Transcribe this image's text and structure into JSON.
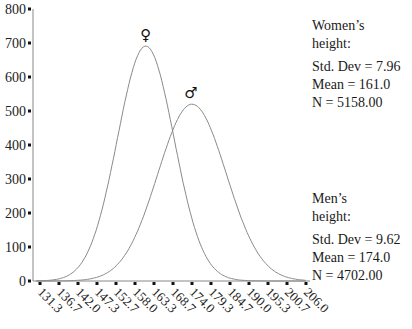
{
  "chart_data": {
    "type": "line",
    "title": "",
    "xlabel": "",
    "ylabel": "",
    "ylim": [
      0,
      800
    ],
    "yticks": [
      0,
      100,
      200,
      300,
      400,
      500,
      600,
      700,
      800
    ],
    "xticks": [
      "131.3",
      "136.7",
      "142.0",
      "147.3",
      "152.7",
      "158.0",
      "163.3",
      "168.7",
      "174.0",
      "179.3",
      "184.7",
      "190.0",
      "195.3",
      "200.7",
      "206.0"
    ],
    "xlim": [
      131.3,
      206.0
    ],
    "grid": false,
    "series": [
      {
        "name": "Women's height",
        "symbol": "♀",
        "mean": 161.0,
        "std_dev": 7.96,
        "n": 5158,
        "peak": 691,
        "x": [
          131.3,
          136.7,
          142.0,
          147.3,
          152.7,
          158.0,
          161.0,
          163.3,
          168.7,
          174.0,
          179.3,
          184.7,
          190.0,
          195.3,
          200.7,
          206.0
        ],
        "values": [
          3,
          23,
          100,
          300,
          399,
          643,
          691,
          660,
          432,
          182,
          49,
          8,
          1,
          0,
          0,
          0
        ]
      },
      {
        "name": "Men's height",
        "symbol": "♂",
        "mean": 174.0,
        "std_dev": 9.62,
        "n": 4702,
        "peak": 520,
        "x": [
          131.3,
          136.7,
          142.0,
          147.3,
          152.7,
          158.0,
          163.3,
          168.7,
          174.0,
          179.3,
          184.7,
          190.0,
          195.3,
          200.7,
          206.0
        ],
        "values": [
          0,
          3,
          2,
          11,
          39,
          130,
          282,
          443,
          520,
          443,
          282,
          130,
          39,
          11,
          2
        ]
      }
    ]
  },
  "legend": {
    "women": {
      "title_line1": "Women’s",
      "title_line2": "height:",
      "std_dev": "Std. Dev = 7.96",
      "mean": "Mean = 161.0",
      "n": "N = 5158.00"
    },
    "men": {
      "title_line1": "Men’s",
      "title_line2": "height:",
      "std_dev": "Std. Dev = 9.62",
      "mean": "Mean = 174.0",
      "n": "N = 4702.00"
    }
  },
  "symbols": {
    "female": "♀",
    "male": "♂"
  }
}
